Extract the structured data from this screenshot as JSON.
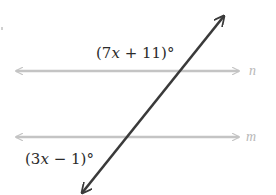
{
  "figure": {
    "parallel_lines": [
      {
        "name": "n",
        "label": "n",
        "y": 71,
        "x1": 16,
        "x2": 239,
        "color": "#c4c4c4"
      },
      {
        "name": "m",
        "label": "m",
        "y": 137,
        "x1": 16,
        "x2": 239,
        "color": "#c4c4c4"
      }
    ],
    "transversal": {
      "x1": 82,
      "y1": 193,
      "x2": 224,
      "y2": 16,
      "color": "#3a3a3a"
    },
    "angles": [
      {
        "id": "angle-top",
        "prefix": "(7",
        "var": "x",
        "suffix": " + 11)°",
        "full": "(7x + 11)°",
        "at_line": "n"
      },
      {
        "id": "angle-bottom",
        "prefix": "(3",
        "var": "x",
        "suffix": " − 1)°",
        "full": "(3x − 1)°",
        "at_line": "m"
      }
    ]
  }
}
